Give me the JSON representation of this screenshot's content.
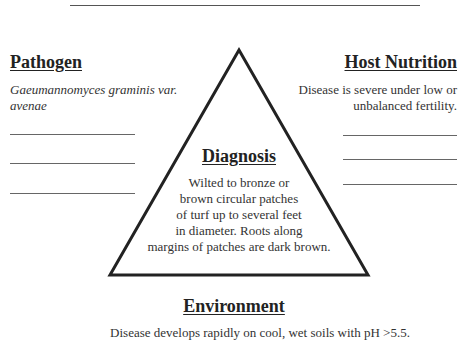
{
  "pathogen": {
    "heading": "Pathogen",
    "text": "Gaeumannomyces graminis var. avenae",
    "blank_lines": 3
  },
  "host_nutrition": {
    "heading": "Host Nutrition",
    "text_line1": "Disease is severe under low or",
    "text_line2": "unbalanced fertility.",
    "blank_lines": 3
  },
  "diagnosis": {
    "heading": "Diagnosis",
    "lines": [
      "Wilted to bronze or",
      "brown circular patches",
      "of turf up to several feet",
      "in diameter.  Roots along",
      "margins of patches are dark brown."
    ]
  },
  "environment": {
    "heading": "Environment",
    "text": "Disease develops rapidly on cool, wet soils with pH >5.5."
  },
  "colors": {
    "line": "#222222",
    "text": "#333333",
    "background": "#ffffff"
  }
}
